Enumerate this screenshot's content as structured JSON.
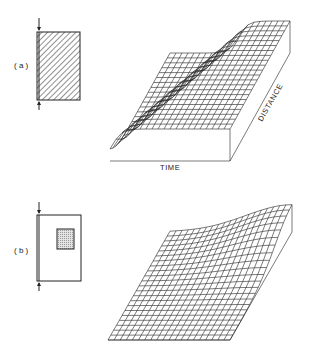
{
  "figure": {
    "panels": [
      {
        "id": "a",
        "label": "( a )",
        "schematic": "fully hatched rectangle with input arrow at top and output arrow at bottom on the left edge",
        "surface_description": "3D mesh surface: steep front travelling across distance over time, plateau behind front",
        "axis_labels": {
          "x": "TIME",
          "y": "DISTANCE"
        }
      },
      {
        "id": "b",
        "label": "( b )",
        "schematic": "open rectangle with small shaded square inset near upper right, arrows on left edge",
        "surface_description": "3D mesh surface: low flat region with narrow peak rising at far distance/late time"
      }
    ],
    "colors": {
      "ink": "#222222",
      "background": "#ffffff",
      "shade": "#bbbbbb"
    }
  }
}
